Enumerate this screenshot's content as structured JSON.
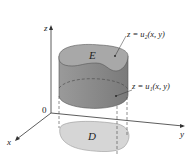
{
  "diagram": {
    "axes": {
      "z_label": "z",
      "y_label": "y",
      "x_label": "x",
      "origin_label": "0"
    },
    "solid_label": "E",
    "region_label": "D",
    "upper_surface_label": "z = u₂(x, y)",
    "lower_surface_label": "z = u₁(x, y)",
    "colors": {
      "solid_side": "#8f8f8f",
      "solid_top": "#a9a9a9",
      "region_fill": "#d6d6d6",
      "axis": "#333333"
    }
  }
}
